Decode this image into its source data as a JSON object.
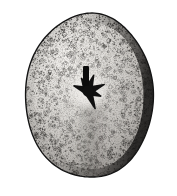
{
  "figure": {
    "kind": "scientific-engraving",
    "technique": "stipple engraving, monochrome",
    "caption": "",
    "background_color": "#ffffff",
    "ink_color": "#1a1a1a",
    "canvas": {
      "width": 177,
      "height": 196
    }
  },
  "specimen": {
    "outline": {
      "center_x": 92,
      "center_y": 96,
      "radius_x": 64,
      "radius_y": 82,
      "left_edge": 28,
      "right_edge": 160,
      "top_edge": 13,
      "bottom_edge": 178,
      "shape": "ovoid-subcircular, slightly wider below mid-height",
      "outline_color": "#141414",
      "outline_width": 1.4
    },
    "body_tone": {
      "base_fill": "#cfcdc9",
      "highlight_fill": "#efedea",
      "shadow_fill": "#6f6c68",
      "highlight_center_x": 72,
      "highlight_center_y": 62,
      "light_direction": "upper-left"
    },
    "rim_shading": {
      "present": true,
      "strongest_side": "right",
      "secondary_side": "lower-right",
      "band_color": "#2e2c2a",
      "band_width": 9
    },
    "median_shadow": {
      "present": true,
      "description": "soft vertical tonal break below centre, lighter left / darker right",
      "x": 92,
      "top_y": 104,
      "bottom_y": 178,
      "color": "#7d7a76"
    }
  },
  "apical_disc": {
    "label": "apical disc / periproct star",
    "center_x": 88,
    "center_y": 91,
    "color": "#101010",
    "arm_count": 6,
    "arm_length": 17,
    "arm_width": 4.5,
    "arms_deg": [
      200,
      243,
      290,
      338,
      22,
      68
    ],
    "madreporite_bar": {
      "present": true,
      "x": 86,
      "top_y": 66,
      "bottom_y": 90,
      "width": 6,
      "color": "#0c0c0c"
    },
    "halo": {
      "present": true,
      "radius": 20,
      "color": "#f2f0ed"
    }
  },
  "surface_texture": {
    "tubercle_count": 520,
    "tubercle_radius_min": 0.7,
    "tubercle_radius_max": 2.1,
    "tubercle_color": "#3a3836",
    "stipple_count": 2600,
    "stipple_color": "#2b2927",
    "description": "dense stippling with scattered ring-like tubercles, coarser toward the margin"
  },
  "ambulacra": {
    "count": 5,
    "description": "faint radiating suture lines from apical disc toward the margin",
    "line_color": "#8b8884",
    "line_width": 0.6,
    "rays_deg": [
      198,
      252,
      306,
      0,
      54,
      108,
      144
    ]
  }
}
